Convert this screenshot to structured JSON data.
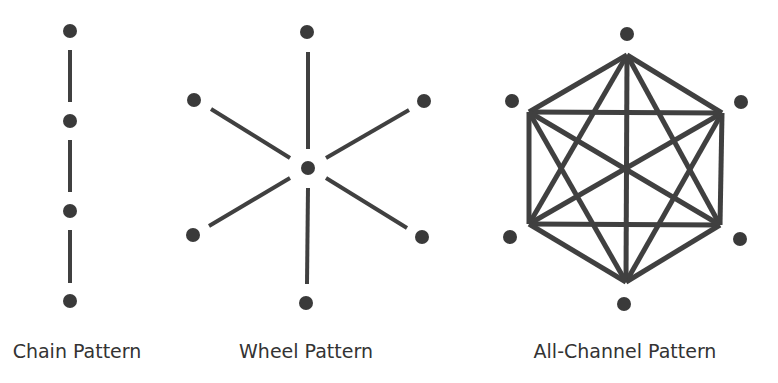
{
  "colors": {
    "node": "#3a3a3a",
    "edge": "#404040",
    "label": "#333333",
    "background": "#ffffff"
  },
  "diagrams": [
    {
      "id": "chain",
      "label": "Chain Pattern",
      "label_x": 77,
      "edge_width": 4,
      "node_radius": 7,
      "nodes": [
        {
          "x": 70,
          "y": 31
        },
        {
          "x": 70,
          "y": 121
        },
        {
          "x": 70,
          "y": 211
        },
        {
          "x": 70,
          "y": 301
        }
      ],
      "edges": [
        {
          "x1": 70,
          "y1": 50,
          "x2": 70,
          "y2": 102
        },
        {
          "x1": 70,
          "y1": 140,
          "x2": 70,
          "y2": 192
        },
        {
          "x1": 70,
          "y1": 230,
          "x2": 70,
          "y2": 283
        }
      ]
    },
    {
      "id": "wheel",
      "label": "Wheel Pattern",
      "label_x": 306,
      "edge_width": 4,
      "node_radius": 7,
      "nodes": [
        {
          "x": 308,
          "y": 168,
          "role": "center"
        },
        {
          "x": 307,
          "y": 32
        },
        {
          "x": 424,
          "y": 101
        },
        {
          "x": 422,
          "y": 237
        },
        {
          "x": 306,
          "y": 303
        },
        {
          "x": 193,
          "y": 235
        },
        {
          "x": 194,
          "y": 100
        }
      ],
      "edges": [
        {
          "x1": 308,
          "y1": 52,
          "x2": 308,
          "y2": 149
        },
        {
          "x1": 409,
          "y1": 110,
          "x2": 326,
          "y2": 158
        },
        {
          "x1": 407,
          "y1": 228,
          "x2": 326,
          "y2": 178
        },
        {
          "x1": 307,
          "y1": 284,
          "x2": 308,
          "y2": 188
        },
        {
          "x1": 209,
          "y1": 226,
          "x2": 290,
          "y2": 178
        },
        {
          "x1": 211,
          "y1": 109,
          "x2": 290,
          "y2": 158
        }
      ]
    },
    {
      "id": "all-channel",
      "label": "All-Channel Pattern",
      "label_x": 625,
      "edge_width": 5,
      "node_radius": 7,
      "nodes": [
        {
          "x": 627,
          "y": 34
        },
        {
          "x": 741,
          "y": 102
        },
        {
          "x": 740,
          "y": 239
        },
        {
          "x": 624,
          "y": 304
        },
        {
          "x": 510,
          "y": 237
        },
        {
          "x": 512,
          "y": 101
        }
      ],
      "vertices": [
        {
          "x": 627,
          "y": 55
        },
        {
          "x": 722,
          "y": 113
        },
        {
          "x": 720,
          "y": 225
        },
        {
          "x": 626,
          "y": 282
        },
        {
          "x": 529,
          "y": 224
        },
        {
          "x": 529,
          "y": 112
        }
      ]
    }
  ]
}
